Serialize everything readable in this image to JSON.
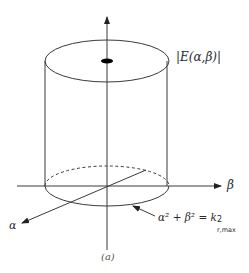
{
  "figure": {
    "caption": "(a)",
    "magnitude_label": "|E(α,β)|",
    "beta_axis_label": "β",
    "alpha_axis_label": "α",
    "equation": {
      "lhs": "α² + β² = k",
      "superscript": "2",
      "subscript": "r,max"
    },
    "colors": {
      "line": "#3a3a3a",
      "dot": "#000000",
      "background": "#ffffff"
    }
  }
}
